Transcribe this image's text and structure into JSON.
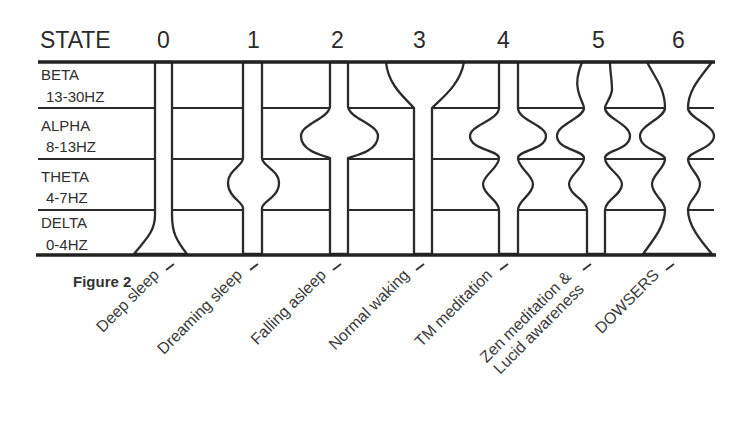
{
  "header": {
    "state_label": "STATE",
    "states": [
      "0",
      "1",
      "2",
      "3",
      "4",
      "5",
      "6"
    ]
  },
  "bands": [
    {
      "name": "BETA",
      "range": "13-30HZ"
    },
    {
      "name": "ALPHA",
      "range": "8-13HZ"
    },
    {
      "name": "THETA",
      "range": "4-7HZ"
    },
    {
      "name": "DELTA",
      "range": "0-4HZ"
    }
  ],
  "figure_label": "Figure 2",
  "state_labels": [
    {
      "lines": [
        "Deep sleep"
      ]
    },
    {
      "lines": [
        "Dreaming sleep"
      ]
    },
    {
      "lines": [
        "Falling asleep"
      ]
    },
    {
      "lines": [
        "Normal waking"
      ]
    },
    {
      "lines": [
        "TM meditation"
      ]
    },
    {
      "lines": [
        "Zen meditation &",
        "Lucid awareness"
      ]
    },
    {
      "lines": [
        "DOWSERS"
      ]
    }
  ],
  "colors": {
    "line": "#2b2b2b",
    "background": "#ffffff"
  }
}
